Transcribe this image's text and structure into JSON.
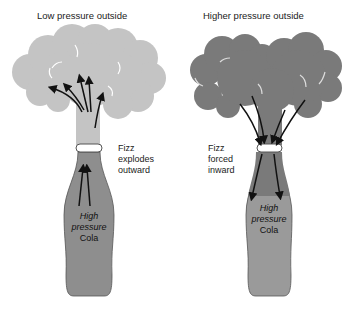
{
  "left_panel": {
    "title": "Low pressure outside",
    "side_label": [
      "Fizz",
      "explodes",
      "outward"
    ],
    "bottle_label": [
      "High",
      "pressure",
      "Cola"
    ],
    "cloud_color": "#c4c4c4",
    "arrow_direction": "outward"
  },
  "right_panel": {
    "title": "Higher pressure outside",
    "side_label": [
      "Fizz",
      "forced",
      "inward"
    ],
    "bottle_label": [
      "High",
      "pressure",
      "Cola"
    ],
    "cloud_color": "#7a7a7a",
    "arrow_direction": "inward"
  },
  "colors": {
    "bottle": "#8e8e8e",
    "bottle_light": "#a6a6a6",
    "arrow": "#111111"
  }
}
